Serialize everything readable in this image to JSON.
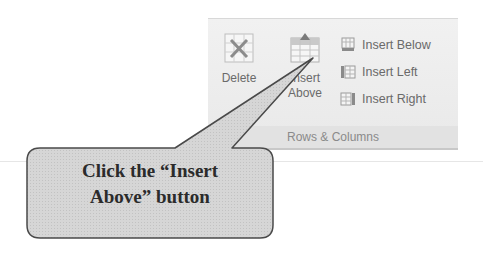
{
  "ribbon": {
    "group_label": "Rows & Columns",
    "large_buttons": [
      {
        "label_line1": "Delete",
        "label_line2": "",
        "icon": "delete-table-icon"
      },
      {
        "label_line1": "Insert",
        "label_line2": "Above",
        "icon": "insert-above-icon"
      }
    ],
    "small_buttons": [
      {
        "label": "Insert Below",
        "icon": "insert-below-icon"
      },
      {
        "label": "Insert Left",
        "icon": "insert-left-icon"
      },
      {
        "label": "Insert Right",
        "icon": "insert-right-icon"
      }
    ]
  },
  "callout": {
    "line1": "Click the “Insert",
    "line2": "Above” button",
    "fill": "#d4d4d4",
    "stroke": "#555555"
  }
}
